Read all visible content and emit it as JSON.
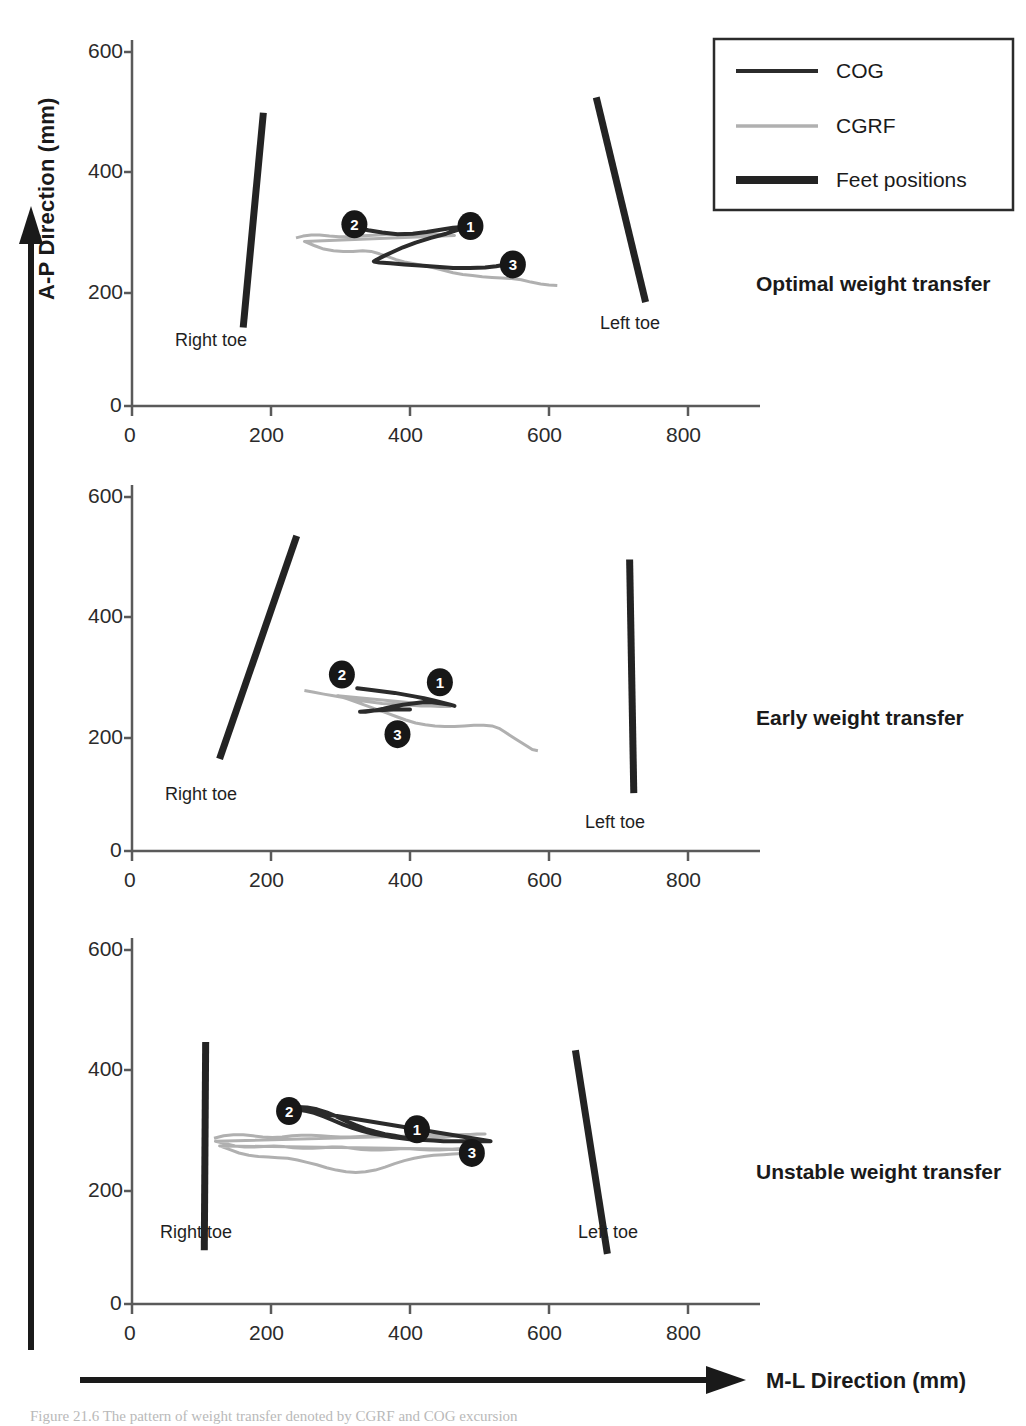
{
  "figure": {
    "y_axis_title": "A-P Direction (mm)",
    "x_axis_title": "M-L Direction (mm)",
    "caption": "Figure 21.6 The pattern of weight transfer denoted by CGRF and COG excursion"
  },
  "legend": {
    "items": [
      {
        "label": "COG",
        "color": "#2b2b2b",
        "width": 3.5
      },
      {
        "label": "CGRF",
        "color": "#b0b0b0",
        "width": 3.0
      },
      {
        "label": "Feet positions",
        "color": "#232323",
        "width": 7.0
      }
    ]
  },
  "chart_data": {
    "type": "line",
    "xlabel": "M-L Direction (mm)",
    "ylabel": "A-P Direction (mm)",
    "xlim": [
      0,
      900
    ],
    "ylim": [
      0,
      640
    ],
    "xticks": [
      0,
      200,
      400,
      600,
      800
    ],
    "yticks": [
      0,
      200,
      400,
      600
    ],
    "grid": false,
    "legend_position": "top-right",
    "series_names": [
      "COG",
      "CGRF",
      "Feet positions"
    ],
    "marker_labels": [
      "1",
      "2",
      "3"
    ],
    "panels": [
      {
        "name": "Optimal weight transfer",
        "right_toe_label": "Right toe",
        "left_toe_label": "Left toe",
        "right_foot": {
          "x1": 160,
          "y1": 133,
          "x2": 189,
          "y2": 497
        },
        "left_foot": {
          "x1": 668,
          "y1": 523,
          "x2": 739,
          "y2": 176
        },
        "markers": [
          {
            "label": "1",
            "x": 487,
            "y": 305
          },
          {
            "label": "2",
            "x": 320,
            "y": 308
          },
          {
            "label": "3",
            "x": 548,
            "y": 240
          }
        ],
        "cog": [
          [
            323,
            302
          ],
          [
            340,
            298
          ],
          [
            360,
            294
          ],
          [
            382,
            291
          ],
          [
            404,
            292
          ],
          [
            424,
            295
          ],
          [
            446,
            299
          ],
          [
            462,
            302
          ],
          [
            472,
            303
          ],
          [
            479,
            303
          ],
          [
            470,
            299
          ],
          [
            452,
            292
          ],
          [
            430,
            285
          ],
          [
            408,
            277
          ],
          [
            390,
            269
          ],
          [
            375,
            261
          ],
          [
            362,
            254
          ],
          [
            352,
            248
          ],
          [
            348,
            245
          ],
          [
            356,
            243
          ],
          [
            372,
            242
          ],
          [
            392,
            240
          ],
          [
            414,
            238
          ],
          [
            438,
            236
          ],
          [
            462,
            234
          ],
          [
            486,
            234
          ],
          [
            508,
            235
          ],
          [
            524,
            237
          ],
          [
            534,
            239
          ]
        ],
        "cgrf": [
          [
            236,
            285
          ],
          [
            246,
            288
          ],
          [
            258,
            290
          ],
          [
            270,
            290
          ],
          [
            284,
            288
          ],
          [
            298,
            287
          ],
          [
            312,
            287
          ],
          [
            326,
            288
          ],
          [
            340,
            289
          ],
          [
            354,
            290
          ],
          [
            368,
            291
          ],
          [
            382,
            291
          ],
          [
            396,
            291
          ],
          [
            410,
            291
          ],
          [
            424,
            291
          ],
          [
            438,
            291
          ],
          [
            452,
            290
          ],
          [
            464,
            289
          ],
          [
            248,
            279
          ],
          [
            262,
            272
          ],
          [
            276,
            266
          ],
          [
            290,
            263
          ],
          [
            304,
            262
          ],
          [
            318,
            262
          ],
          [
            332,
            263
          ],
          [
            344,
            262
          ],
          [
            356,
            258
          ],
          [
            368,
            253
          ],
          [
            380,
            248
          ],
          [
            392,
            244
          ],
          [
            406,
            241
          ],
          [
            420,
            238
          ],
          [
            434,
            234
          ],
          [
            448,
            230
          ],
          [
            462,
            226
          ],
          [
            476,
            223
          ],
          [
            490,
            221
          ],
          [
            504,
            219
          ],
          [
            518,
            218
          ],
          [
            532,
            217
          ],
          [
            546,
            216
          ],
          [
            560,
            214
          ],
          [
            574,
            210
          ],
          [
            588,
            207
          ],
          [
            600,
            205
          ],
          [
            612,
            204
          ]
        ]
      },
      {
        "name": "Early weight transfer",
        "right_toe_label": "Right toe",
        "left_toe_label": "Left toe",
        "right_foot": {
          "x1": 126,
          "y1": 156,
          "x2": 237,
          "y2": 534
        },
        "left_foot": {
          "x1": 716,
          "y1": 494,
          "x2": 722,
          "y2": 98
        },
        "markers": [
          {
            "label": "1",
            "x": 443,
            "y": 286
          },
          {
            "label": "2",
            "x": 302,
            "y": 299
          },
          {
            "label": "3",
            "x": 382,
            "y": 198
          }
        ],
        "cog": [
          [
            324,
            276
          ],
          [
            336,
            274
          ],
          [
            350,
            272
          ],
          [
            364,
            270
          ],
          [
            378,
            268
          ],
          [
            392,
            265
          ],
          [
            406,
            262
          ],
          [
            420,
            259
          ],
          [
            434,
            255
          ],
          [
            448,
            251
          ],
          [
            458,
            248
          ],
          [
            464,
            246
          ],
          [
            458,
            248
          ],
          [
            446,
            250
          ],
          [
            432,
            252
          ],
          [
            418,
            252
          ],
          [
            404,
            250
          ],
          [
            390,
            248
          ],
          [
            376,
            245
          ],
          [
            362,
            241
          ],
          [
            348,
            238
          ],
          [
            336,
            236
          ],
          [
            328,
            236
          ],
          [
            336,
            237
          ],
          [
            348,
            238
          ],
          [
            362,
            239
          ],
          [
            376,
            240
          ],
          [
            390,
            240
          ],
          [
            400,
            240
          ]
        ],
        "cgrf": [
          [
            248,
            272
          ],
          [
            262,
            269
          ],
          [
            276,
            266
          ],
          [
            290,
            263
          ],
          [
            304,
            260
          ],
          [
            318,
            257
          ],
          [
            332,
            254
          ],
          [
            346,
            252
          ],
          [
            360,
            250
          ],
          [
            374,
            249
          ],
          [
            388,
            248
          ],
          [
            402,
            247
          ],
          [
            416,
            246
          ],
          [
            430,
            246
          ],
          [
            444,
            245
          ],
          [
            458,
            245
          ],
          [
            296,
            263
          ],
          [
            310,
            258
          ],
          [
            324,
            252
          ],
          [
            338,
            246
          ],
          [
            352,
            240
          ],
          [
            366,
            234
          ],
          [
            380,
            228
          ],
          [
            394,
            222
          ],
          [
            408,
            217
          ],
          [
            422,
            214
          ],
          [
            436,
            212
          ],
          [
            450,
            211
          ],
          [
            464,
            211
          ],
          [
            478,
            212
          ],
          [
            492,
            213
          ],
          [
            506,
            213
          ],
          [
            518,
            212
          ],
          [
            528,
            208
          ],
          [
            536,
            202
          ],
          [
            544,
            196
          ],
          [
            552,
            190
          ],
          [
            560,
            184
          ],
          [
            568,
            178
          ],
          [
            576,
            172
          ],
          [
            584,
            170
          ]
        ]
      },
      {
        "name": "Unstable weight transfer",
        "right_toe_label": "Right toe",
        "left_toe_label": "Left toe",
        "right_foot": {
          "x1": 104,
          "y1": 91,
          "x2": 106,
          "y2": 444
        },
        "left_foot": {
          "x1": 638,
          "y1": 430,
          "x2": 684,
          "y2": 85
        },
        "markers": [
          {
            "label": "1",
            "x": 410,
            "y": 296
          },
          {
            "label": "2",
            "x": 226,
            "y": 327
          },
          {
            "label": "3",
            "x": 489,
            "y": 256
          }
        ],
        "cog": [
          [
            238,
            334
          ],
          [
            252,
            333
          ],
          [
            266,
            330
          ],
          [
            280,
            325
          ],
          [
            294,
            318
          ],
          [
            308,
            310
          ],
          [
            322,
            303
          ],
          [
            336,
            297
          ],
          [
            350,
            292
          ],
          [
            364,
            288
          ],
          [
            378,
            285
          ],
          [
            392,
            282
          ],
          [
            406,
            280
          ],
          [
            420,
            278
          ],
          [
            434,
            277
          ],
          [
            448,
            276
          ],
          [
            462,
            276
          ],
          [
            476,
            276
          ],
          [
            490,
            276
          ],
          [
            504,
            276
          ],
          [
            516,
            276
          ],
          [
            236,
            330
          ],
          [
            248,
            328
          ],
          [
            262,
            324
          ],
          [
            276,
            318
          ],
          [
            290,
            311
          ],
          [
            304,
            304
          ],
          [
            318,
            298
          ],
          [
            332,
            293
          ],
          [
            346,
            289
          ],
          [
            360,
            286
          ],
          [
            374,
            283
          ],
          [
            388,
            281
          ],
          [
            402,
            279
          ],
          [
            416,
            278
          ]
        ],
        "cgrf": [
          [
            118,
            281
          ],
          [
            132,
            285
          ],
          [
            146,
            287
          ],
          [
            160,
            287
          ],
          [
            174,
            285
          ],
          [
            188,
            283
          ],
          [
            202,
            282
          ],
          [
            216,
            283
          ],
          [
            230,
            285
          ],
          [
            244,
            286
          ],
          [
            258,
            286
          ],
          [
            272,
            285
          ],
          [
            286,
            284
          ],
          [
            300,
            283
          ],
          [
            314,
            283
          ],
          [
            328,
            284
          ],
          [
            342,
            285
          ],
          [
            356,
            286
          ],
          [
            370,
            285
          ],
          [
            384,
            283
          ],
          [
            398,
            281
          ],
          [
            412,
            280
          ],
          [
            426,
            280
          ],
          [
            440,
            281
          ],
          [
            454,
            283
          ],
          [
            468,
            285
          ],
          [
            482,
            287
          ],
          [
            496,
            288
          ],
          [
            508,
            288
          ],
          [
            120,
            276
          ],
          [
            134,
            272
          ],
          [
            148,
            268
          ],
          [
            162,
            266
          ],
          [
            176,
            266
          ],
          [
            190,
            267
          ],
          [
            204,
            268
          ],
          [
            218,
            267
          ],
          [
            232,
            265
          ],
          [
            246,
            264
          ],
          [
            260,
            264
          ],
          [
            274,
            265
          ],
          [
            288,
            266
          ],
          [
            302,
            266
          ],
          [
            316,
            264
          ],
          [
            330,
            262
          ],
          [
            344,
            261
          ],
          [
            358,
            261
          ],
          [
            372,
            262
          ],
          [
            386,
            263
          ],
          [
            400,
            263
          ],
          [
            414,
            262
          ],
          [
            428,
            261
          ],
          [
            442,
            261
          ],
          [
            456,
            262
          ],
          [
            470,
            263
          ],
          [
            484,
            263
          ],
          [
            496,
            262
          ],
          [
            126,
            268
          ],
          [
            140,
            262
          ],
          [
            154,
            256
          ],
          [
            168,
            252
          ],
          [
            182,
            250
          ],
          [
            196,
            249
          ],
          [
            210,
            248
          ],
          [
            224,
            247
          ],
          [
            238,
            244
          ],
          [
            252,
            240
          ],
          [
            266,
            236
          ],
          [
            280,
            231
          ],
          [
            294,
            227
          ],
          [
            308,
            224
          ],
          [
            322,
            223
          ],
          [
            336,
            224
          ],
          [
            350,
            227
          ],
          [
            364,
            232
          ],
          [
            378,
            238
          ],
          [
            392,
            243
          ],
          [
            406,
            247
          ],
          [
            420,
            250
          ],
          [
            434,
            252
          ],
          [
            448,
            253
          ],
          [
            462,
            254
          ],
          [
            476,
            255
          ],
          [
            488,
            256
          ]
        ]
      }
    ]
  }
}
